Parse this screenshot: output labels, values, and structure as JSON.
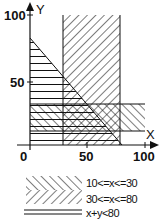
{
  "figure": {
    "axes": {
      "x_label": "X",
      "y_label": "Y",
      "x_ticks": [
        "0",
        "50",
        "100"
      ],
      "y_ticks": [
        "50",
        "100"
      ]
    },
    "regions": [
      {
        "name": "band-10-30",
        "hatch": "forward-slash",
        "range": [
          10,
          30
        ]
      },
      {
        "name": "band-30-80",
        "hatch": "backslash",
        "range": [
          30,
          80
        ]
      },
      {
        "name": "triangle-x-plus-y-lt-80",
        "hatch": "horizontal-lines",
        "limit": 80
      }
    ],
    "legend": [
      {
        "pattern": "forward-slash",
        "label": "10<=x<=30"
      },
      {
        "pattern": "backslash",
        "label": "30<=x<=80"
      },
      {
        "pattern": "double-line",
        "label": "x+y<80"
      }
    ]
  }
}
